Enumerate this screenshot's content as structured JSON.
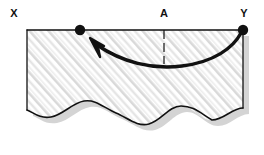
{
  "figure": {
    "kind": "hatched-sheet-diagram",
    "background_color": "#ffffff",
    "ink_color": "#111111",
    "hatch_color": "#b9b9b9",
    "shadow_color": "#d2d2d2",
    "fill_color": "#ffffff"
  },
  "labels": {
    "left": "X",
    "middle": "A",
    "right": "Y"
  },
  "markers": {
    "left_dot": "point-dot",
    "right_dot": "point-dot"
  },
  "annotations": {
    "tick": "dashed-tick-at-A",
    "arrow": "curved-arrow-from-Y-to-left-dot",
    "bottom_edge": "wavy-torn-edge"
  },
  "geometry": {
    "rect_left": 27,
    "rect_right": 243,
    "rect_top": 30,
    "left_dot_x": 80,
    "right_dot_x": 243,
    "tick_x": 164,
    "label_y": 13
  }
}
